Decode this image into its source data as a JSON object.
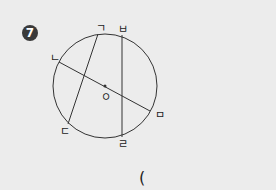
{
  "problem": {
    "number": "7",
    "answer_open": "("
  },
  "diagram": {
    "center_label": "ㅇ",
    "point_labels": {
      "top_left_chord_top": "ㄱ",
      "diameter_left": "ㄴ",
      "chord_bottom_left": "ㄷ",
      "vertical_chord_bottom": "ㄹ",
      "diameter_right": "ㅁ",
      "vertical_chord_top": "ㅂ"
    },
    "colors": {
      "stroke": "#333333",
      "background": "#ececec"
    }
  }
}
